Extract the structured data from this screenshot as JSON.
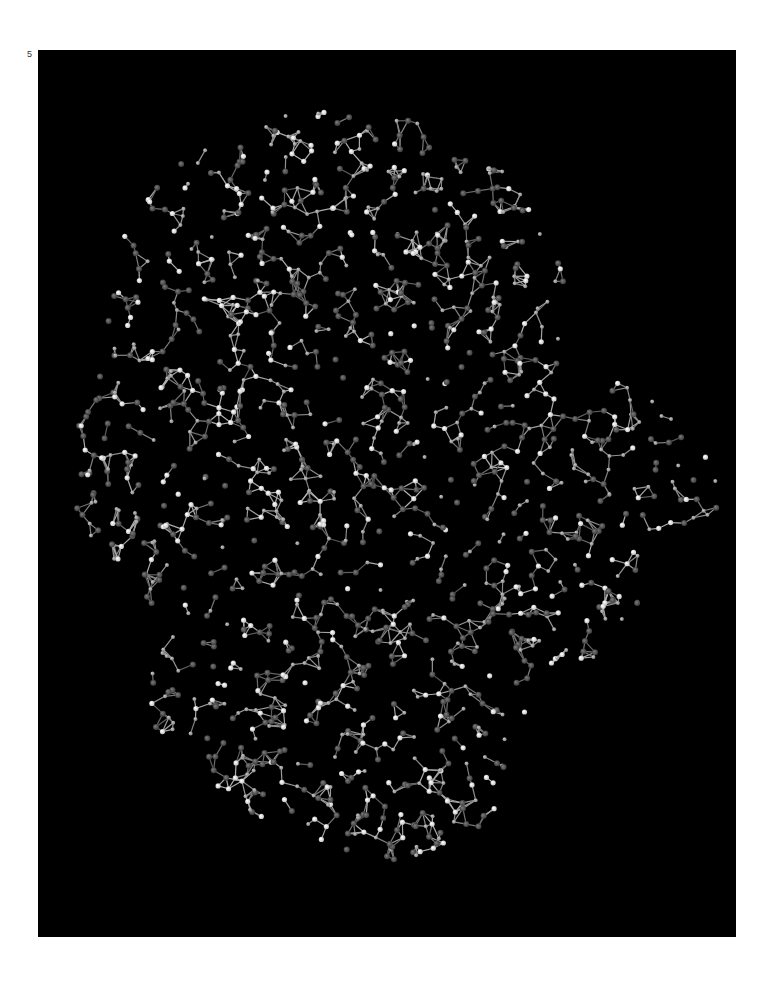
{
  "page": {
    "number_label": "5"
  },
  "figure": {
    "type": "molecular-structure-render",
    "style": "ball-and-stick",
    "background_color": "#000000",
    "atom_color_light": "#e8e8e8",
    "atom_color_dark": "#6a6a6a",
    "bond_color": "#9a9a9a",
    "panel": {
      "x": 38,
      "y": 50,
      "width": 698,
      "height": 887
    }
  }
}
